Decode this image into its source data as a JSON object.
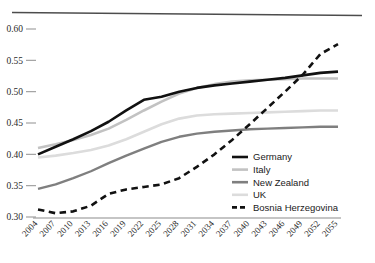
{
  "chart_data": {
    "type": "line",
    "title": "",
    "subtitle": "",
    "xlabel": "",
    "ylabel": "",
    "grid": false,
    "legend_position": "inside-bottom-right",
    "ylim": [
      0.3,
      0.6
    ],
    "ytick_labels": [
      "0.60",
      "0.55",
      "0.50",
      "0.45",
      "0.40",
      "0.35",
      "0.30"
    ],
    "ytick_values": [
      0.6,
      0.55,
      0.5,
      0.45,
      0.4,
      0.35,
      0.3
    ],
    "x": [
      2004,
      2007,
      2010,
      2013,
      2016,
      2019,
      2022,
      2025,
      2028,
      2031,
      2034,
      2037,
      2040,
      2043,
      2046,
      2049,
      2052,
      2055
    ],
    "xtick_labels": [
      "2004",
      "2007",
      "2010",
      "2013",
      "2016",
      "2019",
      "2022",
      "2025",
      "2028",
      "2031",
      "2034",
      "2037",
      "2040",
      "2043",
      "2046",
      "2049",
      "2052",
      "2055"
    ],
    "series": [
      {
        "name": "Germany",
        "color": "#111111",
        "style": "solid",
        "width": 2.6,
        "values": [
          0.4,
          0.412,
          0.424,
          0.437,
          0.452,
          0.47,
          0.487,
          0.492,
          0.5,
          0.506,
          0.51,
          0.513,
          0.516,
          0.519,
          0.522,
          0.526,
          0.53,
          0.532
        ]
      },
      {
        "name": "Italy",
        "color": "#c2c2c2",
        "style": "solid",
        "width": 2.6,
        "values": [
          0.41,
          0.416,
          0.423,
          0.431,
          0.441,
          0.455,
          0.47,
          0.484,
          0.497,
          0.506,
          0.512,
          0.516,
          0.518,
          0.519,
          0.52,
          0.521,
          0.521,
          0.521
        ]
      },
      {
        "name": "New Zealand",
        "color": "#7f7f7f",
        "style": "solid",
        "width": 2.4,
        "values": [
          0.345,
          0.352,
          0.362,
          0.373,
          0.386,
          0.398,
          0.409,
          0.42,
          0.428,
          0.433,
          0.436,
          0.438,
          0.44,
          0.441,
          0.442,
          0.443,
          0.444,
          0.444
        ]
      },
      {
        "name": "UK",
        "color": "#dcdcdc",
        "style": "solid",
        "width": 2.6,
        "values": [
          0.395,
          0.398,
          0.402,
          0.407,
          0.414,
          0.424,
          0.436,
          0.448,
          0.457,
          0.462,
          0.464,
          0.465,
          0.466,
          0.467,
          0.468,
          0.469,
          0.47,
          0.47
        ]
      },
      {
        "name": "Bosnia Herzegovina",
        "color": "#111111",
        "style": "dashed",
        "width": 2.6,
        "values": [
          0.312,
          0.306,
          0.309,
          0.318,
          0.337,
          0.344,
          0.348,
          0.352,
          0.362,
          0.38,
          0.4,
          0.423,
          0.448,
          0.474,
          0.5,
          0.527,
          0.56,
          0.576
        ]
      }
    ]
  },
  "legend": {
    "entries": [
      {
        "label": "Germany"
      },
      {
        "label": "Italy"
      },
      {
        "label": "New Zealand"
      },
      {
        "label": "UK"
      },
      {
        "label": "Bosnia Herzegovina"
      }
    ]
  },
  "axes": {
    "top_rule_color": "#4d4d4d",
    "bottom_rule_color": "#8c8c8c",
    "tick_mark_color": "#9a9a9a"
  }
}
